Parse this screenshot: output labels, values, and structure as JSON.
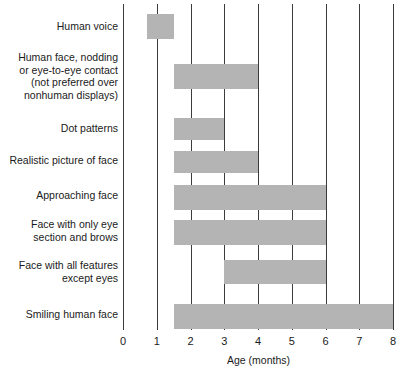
{
  "chart_data": {
    "type": "bar",
    "orientation": "horizontal",
    "title": "",
    "subtitle": "",
    "xlabel": "Age (months)",
    "ylabel": "",
    "xlim": [
      0,
      8
    ],
    "xticks": [
      0,
      1,
      2,
      3,
      4,
      5,
      6,
      7,
      8
    ],
    "xtick_labels": [
      "0",
      "1",
      "2",
      "3",
      "4",
      "5",
      "6",
      "7",
      "8"
    ],
    "grid": true,
    "grid_axis": "x",
    "legend": false,
    "legend_position": "none",
    "bar_color": "#b4b4b4",
    "gridline_color": "#3b3b3b",
    "text_color": "#1a1a1a",
    "background_color": "#ffffff",
    "categories": [
      "Human voice",
      "Human face, nodding\nor eye-to-eye contact\n(not preferred over\nnonhuman displays)",
      "Dot patterns",
      "Realistic picture of face",
      "Approaching face",
      "Face with only eye\nsection and brows",
      "Face with all features\nexcept eyes",
      "Smiling human face"
    ],
    "bars": [
      {
        "category": "Human voice",
        "start": 0.7,
        "end": 1.5,
        "span": 0.8
      },
      {
        "category": "Human face, nodding or eye-to-eye contact (not preferred over nonhuman displays)",
        "start": 1.5,
        "end": 4.0,
        "span": 2.5
      },
      {
        "category": "Dot patterns",
        "start": 1.5,
        "end": 3.0,
        "span": 1.5
      },
      {
        "category": "Realistic picture of face",
        "start": 1.5,
        "end": 4.0,
        "span": 2.5
      },
      {
        "category": "Approaching face",
        "start": 1.5,
        "end": 6.0,
        "span": 4.5
      },
      {
        "category": "Face with only eye section and brows",
        "start": 1.5,
        "end": 6.0,
        "span": 4.5
      },
      {
        "category": "Face with all features except eyes",
        "start": 3.0,
        "end": 6.0,
        "span": 3.0
      },
      {
        "category": "Smiling human face",
        "start": 1.5,
        "end": 8.0,
        "span": 6.5
      }
    ]
  },
  "axis": {
    "x_title": "Age (months)",
    "ticks": [
      "0",
      "1",
      "2",
      "3",
      "4",
      "5",
      "6",
      "7",
      "8"
    ]
  },
  "labels": {
    "c0": "Human voice",
    "c1": "Human face, nodding\nor eye-to-eye contact\n(not preferred over\nnonhuman displays)",
    "c2": "Dot patterns",
    "c3": "Realistic picture of face",
    "c4": "Approaching face",
    "c5": "Face with only eye\nsection and brows",
    "c6": "Face with all features\nexcept eyes",
    "c7": "Smiling human face"
  }
}
